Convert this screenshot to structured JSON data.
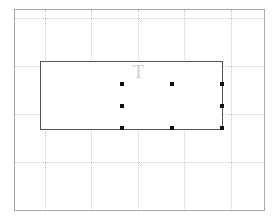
{
  "canvas": {
    "grid_vertical_x": [
      45,
      91,
      138,
      184,
      231
    ],
    "grid_horizontal_y": [
      18,
      66,
      114,
      162
    ],
    "frame_color": "#a8a8a8",
    "grid_color": "#c8c8c8"
  },
  "text_box": {
    "text": "CRU",
    "overflow_text": "T",
    "text_color": "#9a9a9a",
    "border_color": "#555555"
  },
  "selection": {
    "handles": [
      {
        "name": "handle-top-left",
        "x": 120,
        "y": 82
      },
      {
        "name": "handle-top-middle",
        "x": 170,
        "y": 82
      },
      {
        "name": "handle-top-right",
        "x": 220,
        "y": 82
      },
      {
        "name": "handle-middle-left",
        "x": 120,
        "y": 104
      },
      {
        "name": "handle-middle-right",
        "x": 220,
        "y": 104
      },
      {
        "name": "handle-bottom-left",
        "x": 120,
        "y": 126
      },
      {
        "name": "handle-bottom-middle",
        "x": 170,
        "y": 126
      },
      {
        "name": "handle-bottom-right",
        "x": 220,
        "y": 126
      }
    ],
    "handle_color": "#111111"
  }
}
